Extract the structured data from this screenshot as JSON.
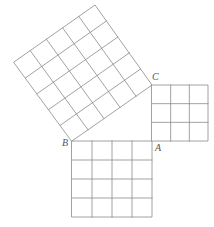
{
  "figure": {
    "background_color": "#ffffff",
    "line_color": "#8a8a8a",
    "line_width": 0.8,
    "label_color": "#555555"
  },
  "labels": {
    "a": "A",
    "b": "B",
    "c": "C"
  },
  "vertices": {
    "A": {
      "x": 152,
      "y": 141
    },
    "B": {
      "x": 72,
      "y": 141
    },
    "C": {
      "x": 152,
      "y": 85
    }
  },
  "label_positions": {
    "a": {
      "x": 155,
      "y": 151
    },
    "b": {
      "x": 60,
      "y": 146
    },
    "c": {
      "x": 152,
      "y": 78
    }
  },
  "squares": [
    {
      "name": "square-on-ac",
      "side_label": "AC",
      "divisions": 3,
      "cell_count": 9,
      "side_px": 56,
      "orientation": "axis-aligned",
      "corners": [
        {
          "x": 152,
          "y": 85
        },
        {
          "x": 208,
          "y": 85
        },
        {
          "x": 208,
          "y": 141
        },
        {
          "x": 152,
          "y": 141
        }
      ]
    },
    {
      "name": "square-on-ab",
      "side_label": "AB",
      "divisions": 4,
      "cell_count": 16,
      "side_px": 76,
      "orientation": "axis-aligned",
      "corners": [
        {
          "x": 72,
          "y": 141
        },
        {
          "x": 152,
          "y": 141
        },
        {
          "x": 152,
          "y": 217
        },
        {
          "x": 72,
          "y": 217
        }
      ]
    },
    {
      "name": "square-on-bc",
      "side_label": "BC",
      "divisions": 5,
      "cell_count": 25,
      "side_px": 98,
      "orientation": "rotated",
      "corners": [
        {
          "x": 72,
          "y": 141
        },
        {
          "x": 152,
          "y": 85
        },
        {
          "x": 95,
          "y": 5
        },
        {
          "x": 14,
          "y": 62
        }
      ]
    }
  ],
  "chart_data": {
    "type": "diagram",
    "triangle": {
      "vertices": [
        "A",
        "B",
        "C"
      ],
      "right_angle_at": "A",
      "leg_ab_units": 4,
      "leg_ac_units": 3,
      "hypotenuse_bc_units": 5
    },
    "squares": [
      {
        "side": "AC",
        "grid": "3x3",
        "units_squared": 9,
        "position": "right"
      },
      {
        "side": "AB",
        "grid": "4x4",
        "units_squared": 16,
        "position": "bottom"
      },
      {
        "side": "BC",
        "grid": "5x5",
        "units_squared": 25,
        "position": "upper-left (rotated)"
      }
    ],
    "relation": "9 + 16 = 25"
  }
}
